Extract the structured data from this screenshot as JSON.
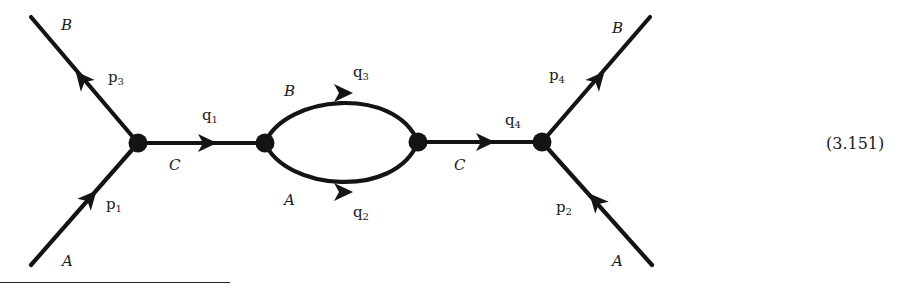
{
  "equation_number": "(3.151)",
  "diagram": {
    "vertices": [
      {
        "id": "v1",
        "x": 138,
        "y": 143
      },
      {
        "id": "v2",
        "x": 265,
        "y": 143
      },
      {
        "id": "v3",
        "x": 418,
        "y": 142
      },
      {
        "id": "v4",
        "x": 542,
        "y": 142
      }
    ],
    "edges": [
      {
        "id": "p1",
        "field": "A",
        "momentum": "p",
        "momentum_sub": "1",
        "from": "external-lower-left",
        "to": "v1"
      },
      {
        "id": "p3",
        "field": "B",
        "momentum": "p",
        "momentum_sub": "3",
        "from": "v1",
        "to": "external-upper-left"
      },
      {
        "id": "q1",
        "field": "C",
        "momentum": "q",
        "momentum_sub": "1",
        "from": "v1",
        "to": "v2"
      },
      {
        "id": "q3",
        "field": "B",
        "momentum": "q",
        "momentum_sub": "3",
        "from": "v2",
        "to": "v3",
        "shape": "upper-arc"
      },
      {
        "id": "q2",
        "field": "A",
        "momentum": "q",
        "momentum_sub": "2",
        "from": "v2",
        "to": "v3",
        "shape": "lower-arc"
      },
      {
        "id": "q4",
        "field": "C",
        "momentum": "q",
        "momentum_sub": "4",
        "from": "v3",
        "to": "v4"
      },
      {
        "id": "p4",
        "field": "B",
        "momentum": "p",
        "momentum_sub": "4",
        "from": "v4",
        "to": "external-upper-right"
      },
      {
        "id": "p2",
        "field": "A",
        "momentum": "p",
        "momentum_sub": "2",
        "from": "external-lower-right",
        "to": "v4"
      }
    ]
  },
  "labels": {
    "field_B_top_left": "B",
    "field_A_bottom_left": "A",
    "field_C_left": "C",
    "field_B_loop": "B",
    "field_A_loop": "A",
    "field_C_right": "C",
    "field_B_top_right": "B",
    "field_A_bottom_right": "A",
    "p3": {
      "base": "p",
      "sub": "3"
    },
    "p1": {
      "base": "p",
      "sub": "1"
    },
    "q1": {
      "base": "q",
      "sub": "1"
    },
    "q3": {
      "base": "q",
      "sub": "3"
    },
    "q2": {
      "base": "q",
      "sub": "2"
    },
    "q4": {
      "base": "q",
      "sub": "4"
    },
    "p4": {
      "base": "p",
      "sub": "4"
    },
    "p2": {
      "base": "p",
      "sub": "2"
    }
  },
  "colors": {
    "ink": "#141414",
    "background": "#ffffff"
  }
}
